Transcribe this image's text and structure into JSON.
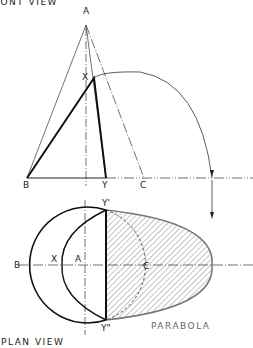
{
  "front_view": {
    "title": "FRONT VIEW",
    "labels": {
      "apex": "A",
      "section_point": "X",
      "base_left": "B",
      "base_right": "Y",
      "cut_point": "C"
    }
  },
  "plan_view": {
    "title": "PLAN VIEW",
    "labels": {
      "base_left": "B",
      "section_point": "X",
      "center": "A",
      "cut_point": "C",
      "top_point": "Y'",
      "bottom_point": "Y\""
    },
    "curve_label": "PARABOLA"
  },
  "colors": {
    "ink": "#222222",
    "hatch": "#555555",
    "parabola_outline": "#777777"
  }
}
